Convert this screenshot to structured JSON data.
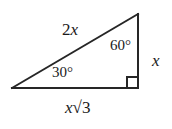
{
  "figure": {
    "type": "right-triangle",
    "background_color": "#ffffff",
    "stroke_color": "#262626",
    "stroke_width": 2,
    "vertices": {
      "left": [
        12,
        88
      ],
      "bottom_right": [
        138,
        88
      ],
      "top_right": [
        138,
        14
      ]
    },
    "right_angle_marker": {
      "at": "bottom_right",
      "size": 11
    }
  },
  "labels": {
    "hypotenuse": {
      "coefficient": "2",
      "variable": "x",
      "text": "2x",
      "side": "hypotenuse"
    },
    "vertical_leg": {
      "variable": "x",
      "text": "x",
      "side": "opposite-30"
    },
    "base_leg": {
      "variable": "x",
      "radical": "√3",
      "text": "x√3",
      "side": "opposite-60"
    },
    "angle_top": {
      "value": "60",
      "unit": "°",
      "text": "60°"
    },
    "angle_left": {
      "value": "30",
      "unit": "°",
      "text": "30°"
    }
  }
}
